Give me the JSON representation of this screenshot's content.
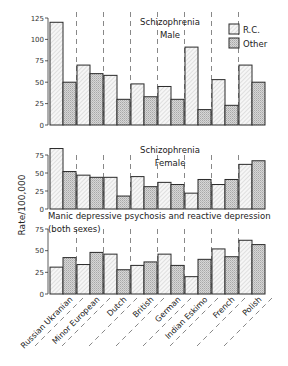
{
  "chart_data": [
    {
      "type": "bar",
      "title": "Schizophrenia Male",
      "title_lines": [
        "Schizophrenia",
        "Male"
      ],
      "ylabel": "Rate/100,000",
      "ylim": [
        0,
        125
      ],
      "yticks": [
        0,
        25,
        50,
        75,
        100,
        125
      ],
      "categories": [
        "Russian Ukranian",
        "Minor European",
        "Dutch",
        "British",
        "German",
        "Indian Eskimo",
        "French",
        "Polish"
      ],
      "series": [
        {
          "name": "R.C.",
          "values": [
            120,
            70,
            58,
            48,
            45,
            91,
            53,
            70
          ]
        },
        {
          "name": "Other",
          "values": [
            50,
            60,
            30,
            33,
            30,
            18,
            23,
            50
          ]
        }
      ],
      "legend_position": "upper right",
      "grid": false
    },
    {
      "type": "bar",
      "title": "Schizophrenia Female",
      "title_lines": [
        "Schizophrenia",
        "Female"
      ],
      "ylabel": "Rate/100,000",
      "ylim": [
        0,
        85
      ],
      "yticks": [
        0,
        25,
        50,
        75
      ],
      "categories": [
        "Russian Ukranian",
        "Minor European",
        "Dutch",
        "British",
        "German",
        "Indian Eskimo",
        "French",
        "Polish"
      ],
      "series": [
        {
          "name": "R.C.",
          "values": [
            84,
            47,
            44,
            45,
            37,
            22,
            34,
            62
          ]
        },
        {
          "name": "Other",
          "values": [
            52,
            44,
            18,
            31,
            34,
            41,
            41,
            67
          ]
        }
      ],
      "grid": false
    },
    {
      "type": "bar",
      "title": "Manic depressive psychosis and reactive depression (both sexes)",
      "title_lines": [
        "Manic depressive psychosis and reactive depression",
        "(both sexes)"
      ],
      "ylabel": "Rate/100,000",
      "ylim": [
        0,
        75
      ],
      "yticks": [
        0,
        25,
        50,
        75
      ],
      "categories": [
        "Russian Ukranian",
        "Minor European",
        "Dutch",
        "British",
        "German",
        "Indian Eskimo",
        "French",
        "Polish"
      ],
      "series": [
        {
          "name": "R.C.",
          "values": [
            31,
            34,
            46,
            33,
            46,
            20,
            52,
            62
          ]
        },
        {
          "name": "Other",
          "values": [
            42,
            48,
            28,
            37,
            33,
            40,
            43,
            57
          ]
        }
      ],
      "grid": false
    }
  ],
  "shared": {
    "ylabel": "Rate/100,000",
    "legend": [
      {
        "name": "R.C.",
        "pattern": "hatched-light"
      },
      {
        "name": "Other",
        "pattern": "stippled-gray"
      }
    ]
  }
}
